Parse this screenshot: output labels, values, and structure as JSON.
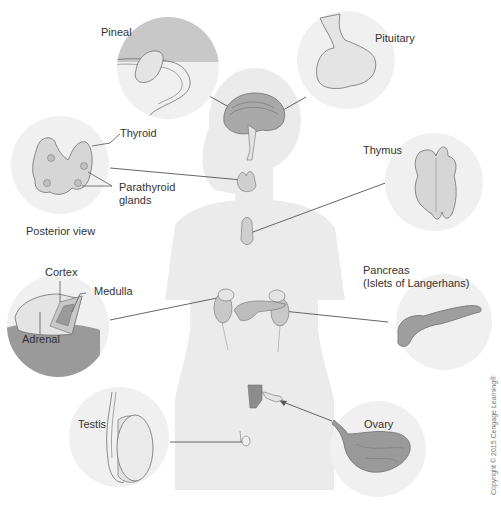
{
  "diagram": {
    "type": "endocrine-system-anatomy",
    "colors": {
      "background": "#ffffff",
      "silhouette": "#ebebeb",
      "circle_bg": "#f0f0f0",
      "tissue_light": "#e4e4e4",
      "tissue_mid": "#c8c8c8",
      "tissue_dark": "#9a9a9a",
      "outline": "#6e6e6e",
      "leader_line": "#555555",
      "text": "#333333"
    },
    "glands": [
      {
        "id": "pineal",
        "label": "Pineal"
      },
      {
        "id": "pituitary",
        "label": "Pituitary"
      },
      {
        "id": "thyroid",
        "label": "Thyroid",
        "sub_label": "Parathyroid glands",
        "sub_label_line1": "Parathyroid",
        "sub_label_line2": "glands",
        "view_caption": "Posterior view"
      },
      {
        "id": "thymus",
        "label": "Thymus"
      },
      {
        "id": "adrenal",
        "label": "Adrenal",
        "parts": [
          "Cortex",
          "Medulla"
        ]
      },
      {
        "id": "pancreas",
        "label": "Pancreas",
        "sub_label": "(Islets of Langerhans)"
      },
      {
        "id": "testis",
        "label": "Testis"
      },
      {
        "id": "ovary",
        "label": "Ovary"
      }
    ],
    "labels": {
      "pineal": "Pineal",
      "pituitary": "Pituitary",
      "thyroid": "Thyroid",
      "parathyroid_1": "Parathyroid",
      "parathyroid_2": "glands",
      "posterior_view": "Posterior view",
      "thymus": "Thymus",
      "cortex": "Cortex",
      "medulla": "Medulla",
      "adrenal": "Adrenal",
      "pancreas_1": "Pancreas",
      "pancreas_2": "(Islets of Langerhans)",
      "testis": "Testis",
      "ovary": "Ovary"
    },
    "copyright": "Copyright © 2015 Cengage Learning®"
  }
}
